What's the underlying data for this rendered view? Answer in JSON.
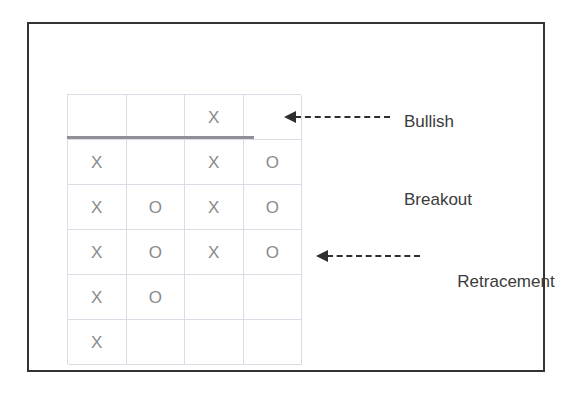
{
  "figure": {
    "title_visible": false,
    "type": "point-and-figure-chart",
    "border_color": "#333333",
    "background_color": "#ffffff"
  },
  "grid": {
    "columns": 4,
    "rows": 6,
    "line_color": "#dcdce6",
    "mark_color": "#8a8a8a",
    "cells": [
      [
        "",
        "",
        "X",
        ""
      ],
      [
        "X",
        "",
        "X",
        "O"
      ],
      [
        "X",
        "O",
        "X",
        "O"
      ],
      [
        "X",
        "O",
        "X",
        "O"
      ],
      [
        "X",
        "O",
        "",
        ""
      ],
      [
        "X",
        "",
        "",
        ""
      ]
    ]
  },
  "resistance_line": {
    "color": "#8f8f97",
    "spans_columns": 3
  },
  "annotations": [
    {
      "id": "breakout",
      "label_lines": [
        "Bullish",
        "Breakout"
      ],
      "arrow_direction": "left",
      "arrow_style": "dashed",
      "color": "#2e2e2e"
    },
    {
      "id": "retracement",
      "label_lines": [
        "Retracement"
      ],
      "arrow_direction": "left",
      "arrow_style": "dashed",
      "color": "#2e2e2e"
    }
  ],
  "chart_data": {
    "type": "table",
    "title": "",
    "subtitle": "",
    "xlabel": "",
    "ylabel": "",
    "grid": true,
    "legend_position": "none",
    "notation": "Point and Figure chart: X = rising column, O = falling column",
    "columns": [
      "Column 1",
      "Column 2",
      "Column 3",
      "Column 4"
    ],
    "rows": [
      {
        "row": 1,
        "values": [
          "",
          "",
          "X",
          ""
        ]
      },
      {
        "row": 2,
        "values": [
          "X",
          "",
          "X",
          "O"
        ]
      },
      {
        "row": 3,
        "values": [
          "X",
          "O",
          "X",
          "O"
        ]
      },
      {
        "row": 4,
        "values": [
          "X",
          "O",
          "X",
          "O"
        ]
      },
      {
        "row": 5,
        "values": [
          "X",
          "O",
          "",
          ""
        ]
      },
      {
        "row": 6,
        "values": [
          "X",
          "",
          "",
          ""
        ]
      }
    ],
    "series": [
      {
        "name": "Column 1 (X / up)",
        "marks": "X",
        "rows_filled": [
          2,
          3,
          4,
          5,
          6
        ],
        "count": 5
      },
      {
        "name": "Column 2 (O / down)",
        "marks": "O",
        "rows_filled": [
          3,
          4,
          5
        ],
        "count": 3
      },
      {
        "name": "Column 3 (X / up)",
        "marks": "X",
        "rows_filled": [
          1,
          2,
          3,
          4
        ],
        "count": 4
      },
      {
        "name": "Column 4 (O / down)",
        "marks": "O",
        "rows_filled": [
          2,
          3,
          4
        ],
        "count": 3
      }
    ],
    "annotations": [
      {
        "text": "Bullish Breakout",
        "points_to": "column 3 X above the resistance line (row 1)"
      },
      {
        "text": "Retracement",
        "points_to": "column 4 O at row 4"
      }
    ],
    "reference_lines": [
      {
        "name": "resistance",
        "orientation": "horizontal",
        "between_rows": [
          1,
          2
        ],
        "color": "#8f8f97"
      }
    ]
  }
}
